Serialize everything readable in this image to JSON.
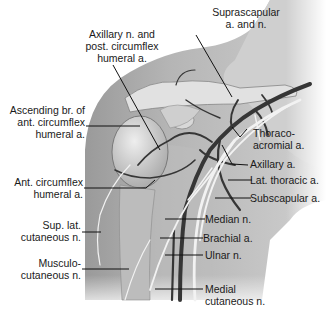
{
  "figure": {
    "type": "anatomical-illustration",
    "colors": {
      "background": "#ffffff",
      "skin_shade": "#a9a9a9",
      "skin_light": "#c8c8c8",
      "bone": "#dcdcdc",
      "vessel": "#3a3a3a",
      "nerve": "#efefef",
      "leader_line": "#111111",
      "label_text": "#1a1a1a"
    }
  },
  "labels": {
    "suprascapular": "Suprascapular\na. and n.",
    "axillary_n_post_circumflex": "Axillary n. and\npost. circumflex\nhumeral a.",
    "ascending_br": "Ascending br. of\nant. circumflex\nhumeral a.",
    "thoracoacromial": "Thoraco-\nacromial a.",
    "axillary_a": "Axillary a.",
    "lat_thoracic": "Lat. thoracic a.",
    "ant_circumflex": "Ant. circumflex\nhumeral a.",
    "subscapular": "Subscapular a.",
    "sup_lat_cutaneous": "Sup. lat.\ncutaneous n.",
    "median_n": "Median n.",
    "brachial_a": "Brachial a.",
    "musculocutaneous": "Musculo-\ncutaneous n.",
    "ulnar_n": "Ulnar n.",
    "medial_cutaneous": "Medial\ncutaneous n."
  }
}
